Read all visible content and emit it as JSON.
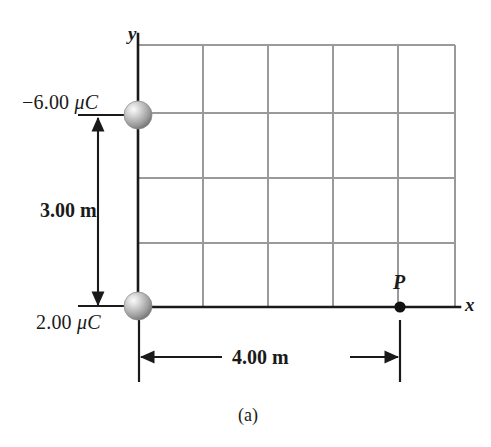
{
  "figure": {
    "caption": "(a)",
    "axes": {
      "x_label": "x",
      "y_label": "y"
    },
    "charges": [
      {
        "name": "upper-charge",
        "label_sign": "−6.00 ",
        "label_unit": "μC",
        "full_label": "−6.00 μC",
        "value": -6.0,
        "unit": "μC",
        "position_m": [
          0,
          3.0
        ]
      },
      {
        "name": "lower-charge",
        "label_sign": "2.00 ",
        "label_unit": "μC",
        "full_label": "2.00 μC",
        "value": 2.0,
        "unit": "μC",
        "position_m": [
          0,
          0
        ]
      }
    ],
    "point": {
      "label": "P",
      "position_m": [
        4.0,
        0
      ]
    },
    "dimensions": [
      {
        "name": "vertical-dimension",
        "label": "3.00 m",
        "value": 3.0,
        "unit": "m",
        "orientation": "vertical"
      },
      {
        "name": "horizontal-dimension",
        "label": "4.00 m",
        "value": 4.0,
        "unit": "m",
        "orientation": "horizontal"
      }
    ],
    "grid": {
      "columns": 5,
      "rows": 4,
      "cell_size_m": 1.0,
      "line_color": "#9a9a9a"
    },
    "colors": {
      "axis": "#1a1a1a",
      "grid": "#9a9a9a",
      "sphere_light": "#f0f0f0",
      "sphere_mid": "#b4b4b4",
      "sphere_dark": "#6e6e6e",
      "text": "#1a1a1a"
    }
  }
}
